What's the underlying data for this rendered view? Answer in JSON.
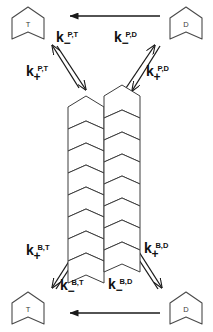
{
  "diagram": {
    "background_color": "#ffffff",
    "stroke_color": "#1a1a1a",
    "monomer_pools": [
      {
        "id": "pool-top-left",
        "label": "T",
        "corner": "top-left",
        "x": 10,
        "y": 6,
        "w": 36,
        "h": 34
      },
      {
        "id": "pool-top-right",
        "label": "D",
        "corner": "top-right",
        "x": 168,
        "y": 6,
        "w": 36,
        "h": 34
      },
      {
        "id": "pool-bottom-left",
        "label": "T",
        "corner": "bottom-left",
        "x": 10,
        "y": 291,
        "w": 36,
        "h": 34
      },
      {
        "id": "pool-bottom-right",
        "label": "D",
        "corner": "bottom-right",
        "x": 168,
        "y": 291,
        "w": 36,
        "h": 34
      }
    ],
    "rate_labels": [
      {
        "id": "k-minus-P-T",
        "k": "k",
        "sub": "−",
        "sup": "P,T",
        "x": 56,
        "y": 30,
        "corner": "top-left"
      },
      {
        "id": "k-plus-P-T",
        "k": "k",
        "sub": "+",
        "sup": "P,T",
        "x": 26,
        "y": 64,
        "corner": "top-left"
      },
      {
        "id": "k-minus-P-D",
        "k": "k",
        "sub": "−",
        "sup": "P,D",
        "x": 114,
        "y": 30,
        "corner": "top-right"
      },
      {
        "id": "k-plus-P-D",
        "k": "k",
        "sub": "+",
        "sup": "P,D",
        "x": 146,
        "y": 64,
        "corner": "top-right"
      },
      {
        "id": "k-plus-B-T",
        "k": "k",
        "sub": "+",
        "sup": "B,T",
        "x": 26,
        "y": 243,
        "corner": "bottom-left"
      },
      {
        "id": "k-minus-B-T",
        "k": "k",
        "sub": "−",
        "sup": "B,T",
        "x": 60,
        "y": 278,
        "corner": "bottom-left"
      },
      {
        "id": "k-plus-B-D",
        "k": "k",
        "sub": "+",
        "sup": "B,D",
        "x": 144,
        "y": 241,
        "corner": "bottom-right"
      },
      {
        "id": "k-minus-B-D",
        "k": "k",
        "sub": "−",
        "sup": "B,D",
        "x": 108,
        "y": 277,
        "corner": "bottom-right"
      }
    ],
    "horizontal_arrows": [
      {
        "id": "arrow-top-hydrolysis",
        "direction": "left",
        "x1": 160,
        "x2": 68,
        "y": 16
      },
      {
        "id": "arrow-bottom-hydrolysis",
        "direction": "left",
        "x1": 160,
        "x2": 68,
        "y": 313
      }
    ],
    "filament": {
      "id": "filament",
      "subunit_count_per_strand": 8,
      "strand_count": 2,
      "strands": [
        {
          "id": "protofilament-left",
          "x": 67,
          "top": 94,
          "width": 36,
          "subunit_height": 22,
          "offset": 0
        },
        {
          "id": "protofilament-right",
          "x": 103,
          "top": 83,
          "width": 36,
          "subunit_height": 22,
          "offset": 11
        }
      ]
    }
  }
}
